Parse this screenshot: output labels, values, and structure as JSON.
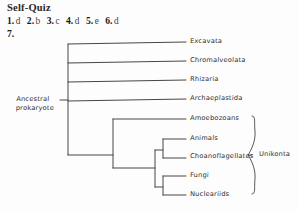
{
  "quiz": {
    "title": "Self-Quiz",
    "answers": [
      {
        "number": "1.",
        "value": "d"
      },
      {
        "number": "2.",
        "value": "b"
      },
      {
        "number": "3.",
        "value": "c"
      },
      {
        "number": "4.",
        "value": "d"
      },
      {
        "number": "5.",
        "value": "e"
      },
      {
        "number": "6.",
        "value": "d"
      }
    ],
    "next_number": "7."
  },
  "diagram": {
    "root_label_line1": "Ancestral",
    "root_label_line2": "prokaryote",
    "clade_label": "Unikonta",
    "tips": [
      {
        "label": "Excavata",
        "y": 44
      },
      {
        "label": "Chromalveolata",
        "y": 63
      },
      {
        "label": "Rhizaria",
        "y": 82
      },
      {
        "label": "Archaeplastida",
        "y": 101
      },
      {
        "label": "Amoebozoans",
        "y": 121
      },
      {
        "label": "Animals",
        "y": 141
      },
      {
        "label": "Choanoflagellates",
        "y": 159
      },
      {
        "label": "Fungi",
        "y": 178
      },
      {
        "label": "Nucleariids",
        "y": 196
      }
    ],
    "line_color": "#4a4442",
    "line_width": 1
  }
}
